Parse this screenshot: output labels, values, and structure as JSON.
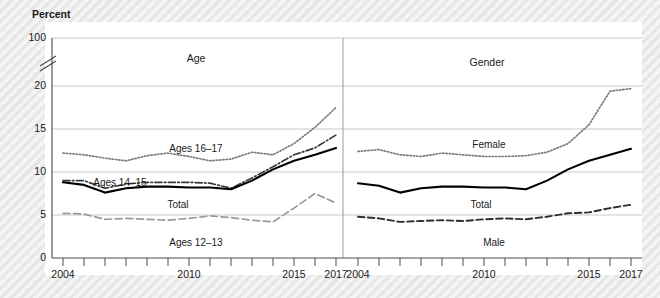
{
  "chart_data": {
    "type": "line",
    "title": "",
    "ylabel": "Percent",
    "xlabel": "",
    "ylim": [
      0,
      20
    ],
    "y_ticks": [
      0,
      5,
      10,
      15,
      20,
      100
    ],
    "y_axis_break": true,
    "y_axis_break_note": "Axis broken between 20 and 100",
    "grid": true,
    "legend_position": "inline-labels",
    "x": [
      2004,
      2005,
      2006,
      2007,
      2008,
      2009,
      2010,
      2011,
      2012,
      2013,
      2014,
      2015,
      2016,
      2017
    ],
    "x_tick_labels": [
      "2004",
      "",
      "",
      "",
      "",
      "",
      "2010",
      "",
      "",
      "",
      "",
      "2015",
      "",
      "2017"
    ],
    "panels": [
      {
        "name": "age-panel",
        "title": "Age",
        "series": [
          {
            "name": "Ages 16–17",
            "style": "dotted",
            "values": [
              12.2,
              12.0,
              11.6,
              11.3,
              11.9,
              12.2,
              11.8,
              11.3,
              11.5,
              12.3,
              12.0,
              13.3,
              15.2,
              17.5
            ]
          },
          {
            "name": "Ages 14–15",
            "style": "dash-dot",
            "values": [
              9.0,
              9.0,
              8.1,
              8.6,
              8.8,
              8.8,
              8.8,
              8.7,
              8.1,
              9.3,
              10.6,
              12.0,
              12.8,
              14.3
            ]
          },
          {
            "name": "Total",
            "style": "solid",
            "values": [
              8.8,
              8.5,
              7.6,
              8.1,
              8.3,
              8.3,
              8.2,
              8.2,
              8.0,
              9.0,
              10.3,
              11.3,
              12.0,
              12.8
            ]
          },
          {
            "name": "Ages 12–13",
            "style": "long-dash",
            "values": [
              5.2,
              5.1,
              4.5,
              4.6,
              4.5,
              4.4,
              4.6,
              4.9,
              4.7,
              4.4,
              4.2,
              5.8,
              7.5,
              6.4
            ]
          }
        ]
      },
      {
        "name": "gender-panel",
        "title": "Gender",
        "series": [
          {
            "name": "Female",
            "style": "dotted",
            "values": [
              12.4,
              12.6,
              12.0,
              11.8,
              12.2,
              12.0,
              11.8,
              11.8,
              11.9,
              12.3,
              13.3,
              15.5,
              19.4,
              19.7
            ]
          },
          {
            "name": "Total",
            "style": "solid",
            "values": [
              8.7,
              8.4,
              7.6,
              8.1,
              8.3,
              8.3,
              8.2,
              8.2,
              8.0,
              9.0,
              10.3,
              11.3,
              12.0,
              12.7
            ]
          },
          {
            "name": "Male",
            "style": "dashed",
            "values": [
              4.8,
              4.6,
              4.2,
              4.3,
              4.4,
              4.3,
              4.5,
              4.6,
              4.5,
              4.8,
              5.2,
              5.3,
              5.8,
              6.2
            ]
          }
        ]
      }
    ]
  },
  "axis": {
    "ylabel": "Percent",
    "y_ticks": [
      "100",
      "20",
      "15",
      "10",
      "5",
      "0"
    ],
    "x_ticks_left": [
      "2004",
      "2010",
      "2015",
      "2017"
    ],
    "x_ticks_right": [
      "2004",
      "2010",
      "2015",
      "2017"
    ]
  },
  "labels": {
    "panel_age": "Age",
    "panel_gender": "Gender",
    "ages_16_17": "Ages 16–17",
    "ages_14_15": "Ages 14–15",
    "ages_12_13": "Ages 12–13",
    "total_left": "Total",
    "total_right": "Total",
    "female": "Female",
    "male": "Male"
  }
}
